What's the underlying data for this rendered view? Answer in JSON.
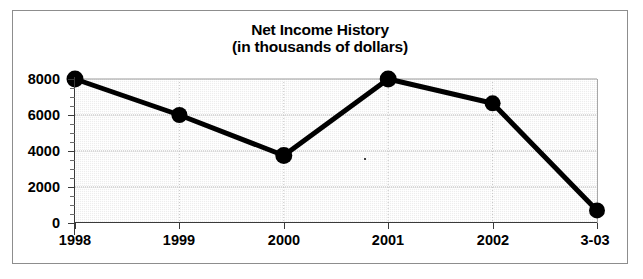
{
  "chart_data": {
    "type": "line",
    "title": "Net Income History",
    "subtitle": "(in thousands of dollars)",
    "xlabel": "",
    "ylabel": "",
    "categories": [
      "1998",
      "1999",
      "2000",
      "2001",
      "2002",
      "3-03"
    ],
    "values": [
      8000,
      6000,
      3750,
      8000,
      6650,
      700
    ],
    "ylim": [
      0,
      8000
    ],
    "yticks": [
      0,
      2000,
      4000,
      6000,
      8000
    ],
    "ytick_labels": [
      "0",
      "2000",
      "4000",
      "6000",
      "8000"
    ],
    "minor_ytick_step": 500,
    "grid": true,
    "legend": null,
    "series": [
      {
        "name": "Net Income",
        "values": [
          8000,
          6000,
          3750,
          8000,
          6650,
          700
        ]
      }
    ],
    "marker": "circle-filled",
    "line_color": "#000000",
    "marker_color": "#000000",
    "plot_background": "#ededed",
    "frame_border_color": "#8d8d8d"
  },
  "chart": {
    "title_line_1": "Net Income History",
    "title_line_2": "(in thousands of dollars)"
  }
}
